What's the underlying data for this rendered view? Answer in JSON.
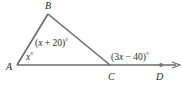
{
  "diagram": {
    "type": "triangle-exterior-angle",
    "colors": {
      "line": "#6a6a6a",
      "text": "#2a2a2a",
      "point": "#7a7a7a"
    },
    "vertices": {
      "A": {
        "label": "A",
        "x": 17,
        "y": 65
      },
      "B": {
        "label": "B",
        "x": 48,
        "y": 14
      },
      "C": {
        "label": "C",
        "x": 110,
        "y": 65
      },
      "D": {
        "label": "D",
        "x": 161,
        "y": 65
      }
    },
    "angles": {
      "A": {
        "var": "x",
        "deg": "°"
      },
      "B": {
        "open": "(",
        "var": "x",
        "rest": " + 20)",
        "deg": "°"
      },
      "exterior_C": {
        "open": "(3",
        "var": "x",
        "rest": " − 40)",
        "deg": "°"
      }
    }
  }
}
